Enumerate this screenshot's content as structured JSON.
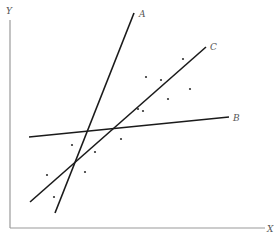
{
  "axes": {
    "x_label": "X",
    "y_label": "Y",
    "axis_color": "#9a9a9a"
  },
  "lines": [
    {
      "id": "A",
      "label": "A",
      "x1": 55,
      "y1": 213,
      "x2": 134,
      "y2": 13,
      "label_x": 139,
      "label_y": 17
    },
    {
      "id": "B",
      "label": "B",
      "x1": 29,
      "y1": 137,
      "x2": 229,
      "y2": 117,
      "label_x": 233,
      "label_y": 121
    },
    {
      "id": "C",
      "label": "C",
      "x1": 30,
      "y1": 202,
      "x2": 206,
      "y2": 47,
      "label_x": 210,
      "label_y": 50
    }
  ],
  "line_color": "#1a1a1a",
  "points": [
    [
      183,
      59
    ],
    [
      146,
      77
    ],
    [
      161,
      80
    ],
    [
      190,
      89
    ],
    [
      168,
      99
    ],
    [
      138,
      109
    ],
    [
      143,
      111
    ],
    [
      121,
      139
    ],
    [
      72,
      145
    ],
    [
      95,
      152
    ],
    [
      85,
      172
    ],
    [
      47,
      175
    ],
    [
      54,
      197
    ]
  ],
  "point_color": "#333333"
}
